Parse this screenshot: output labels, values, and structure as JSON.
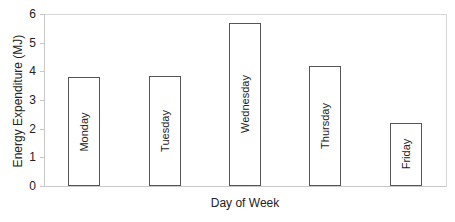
{
  "chart_data": {
    "type": "bar",
    "title": "",
    "xlabel": "Day of Week",
    "ylabel": "Energy Expenditure (MJ)",
    "categories": [
      "Monday",
      "Tuesday",
      "Wednesday",
      "Thursday",
      "Friday"
    ],
    "values": [
      3.8,
      3.85,
      5.7,
      4.2,
      2.2
    ],
    "ylim": [
      0,
      6
    ],
    "yticks": [
      "0",
      "1",
      "2",
      "3",
      "4",
      "5",
      "6"
    ],
    "grid": false,
    "legend": null,
    "bar_labels_inside": true,
    "bar_fill": "#ffffff",
    "bar_edge": "#555555"
  }
}
